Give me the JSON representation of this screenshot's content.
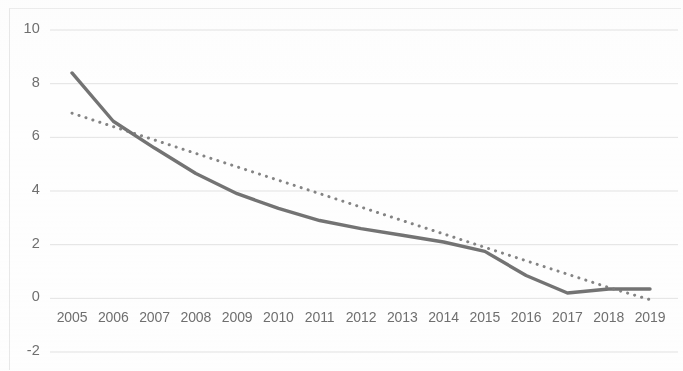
{
  "chart_data": {
    "type": "line",
    "title": "",
    "subtitle": "",
    "xlabel": "",
    "ylabel": "",
    "categories": [
      "2005",
      "2006",
      "2007",
      "2008",
      "2009",
      "2010",
      "2011",
      "2012",
      "2013",
      "2014",
      "2015",
      "2016",
      "2017",
      "2018",
      "2019"
    ],
    "x_tick_labels": [
      "2005",
      "2006",
      "2007",
      "2008",
      "2009",
      "2010",
      "2011",
      "2012",
      "2013",
      "2014",
      "2015",
      "2016",
      "2017",
      "2018",
      "2019"
    ],
    "y_tick_labels": [
      "10",
      "8",
      "6",
      "4",
      "2",
      "0",
      "-2"
    ],
    "y_ticks": [
      10,
      8,
      6,
      4,
      2,
      0,
      -2
    ],
    "ylim": [
      -2,
      10
    ],
    "grid": true,
    "grid_axis": "y",
    "legend": "none",
    "legend_position": "none",
    "series": [
      {
        "name": "data",
        "style": "solid",
        "color": "#6b6b6b",
        "width": 3.4,
        "values": [
          8.4,
          6.6,
          5.6,
          4.65,
          3.9,
          3.35,
          2.9,
          2.6,
          2.35,
          2.1,
          1.75,
          0.85,
          0.2,
          0.35,
          0.35
        ]
      },
      {
        "name": "trendline",
        "style": "dotted",
        "color": "#7a7a7a",
        "width": 2.6,
        "values": [
          6.9,
          6.4,
          5.9,
          5.4,
          4.9,
          4.4,
          3.9,
          3.4,
          2.9,
          2.4,
          1.9,
          1.4,
          0.9,
          0.4,
          -0.05
        ]
      }
    ]
  },
  "axes": {
    "y_axis_label_color": "#6f6f6f",
    "x_axis_label_color": "#6f6f6f",
    "gridline_color": "#d9d9d9",
    "frame_color": "#e8e8e8"
  }
}
